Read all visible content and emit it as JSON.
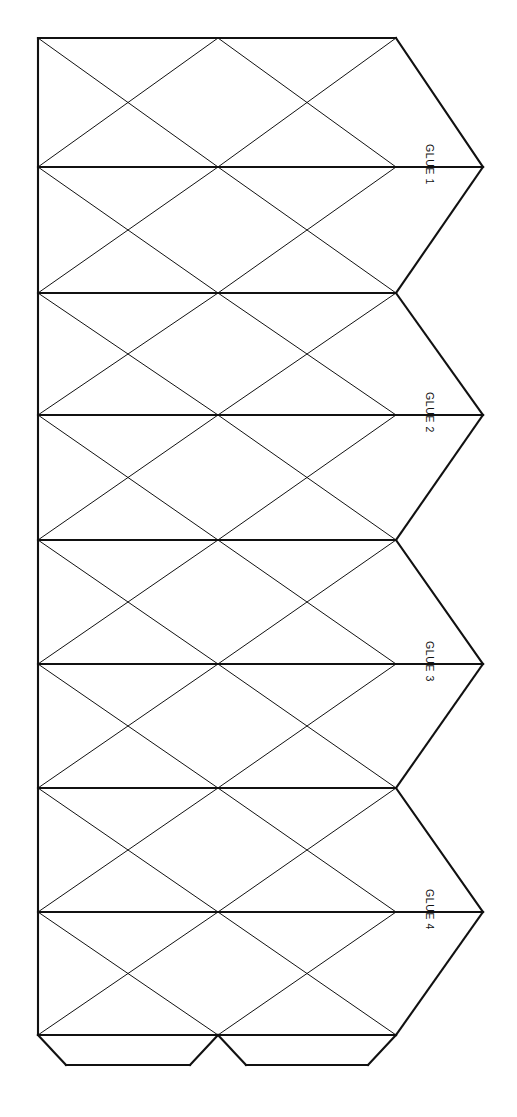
{
  "document": {
    "type": "papercraft-net",
    "title": "Icosahedron Net Template",
    "background_color": "#ffffff",
    "line_color": "#111111",
    "page_width": 517,
    "page_height": 1117
  },
  "geometry": {
    "left_x": 38,
    "mid_x": 218,
    "right_x": 396,
    "tip_x": 483,
    "band_boundaries_y": [
      38,
      293,
      540,
      788,
      1035
    ],
    "band_midlines_y": [
      167,
      415,
      664,
      912
    ],
    "bottom_tab_y": 1065,
    "bottom_tab_inset": 28,
    "heavy_line_width": 2.1,
    "light_line_width": 1.0
  },
  "glue_tabs": {
    "right": [
      {
        "label": "GLUE 1",
        "tip_y": 167
      },
      {
        "label": "GLUE 2",
        "tip_y": 415
      },
      {
        "label": "GLUE 3",
        "tip_y": 664
      },
      {
        "label": "GLUE 4",
        "tip_y": 912
      }
    ],
    "bottom": [
      {
        "label": "",
        "from_x": 38,
        "to_x": 218
      },
      {
        "label": "",
        "from_x": 218,
        "to_x": 396
      }
    ]
  },
  "label_style": {
    "rotation_degrees": 90,
    "font_size_px": 10.5,
    "color": "#111111"
  }
}
